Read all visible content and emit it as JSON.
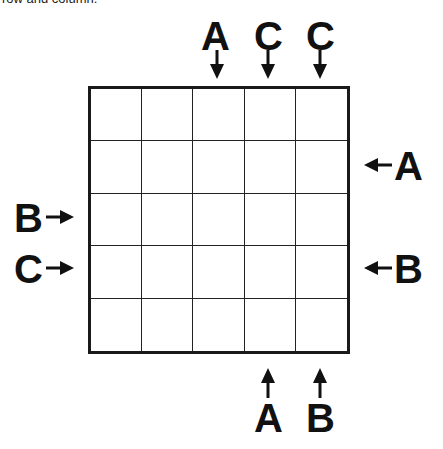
{
  "caption": "row and column.",
  "grid": {
    "rows": 5,
    "cols": 5
  },
  "clues": {
    "top": [
      {
        "col": 3,
        "letter": "A"
      },
      {
        "col": 4,
        "letter": "C"
      },
      {
        "col": 5,
        "letter": "C"
      }
    ],
    "right": [
      {
        "row": 2,
        "letter": "A"
      },
      {
        "row": 4,
        "letter": "B"
      }
    ],
    "left": [
      {
        "row": 3,
        "letter": "B"
      },
      {
        "row": 4,
        "letter": "C"
      }
    ],
    "bottom": [
      {
        "col": 4,
        "letter": "A"
      },
      {
        "col": 5,
        "letter": "B"
      }
    ]
  }
}
